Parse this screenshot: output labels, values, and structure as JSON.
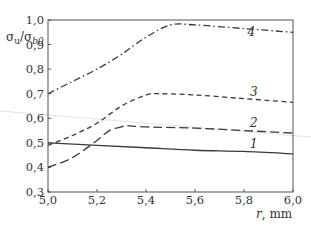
{
  "chart_data": {
    "type": "line",
    "title": "",
    "xlabel": "r, mm",
    "xlabel_var": "r",
    "xlabel_unit": "mm",
    "ylabel": "σu/σb0",
    "ylabel_parts": {
      "sigma1": "σ",
      "sub1": "u",
      "slash": "/",
      "sigma2": "σ",
      "sub2": "b0"
    },
    "xlim": [
      5.0,
      6.0
    ],
    "ylim": [
      0.3,
      1.0
    ],
    "grid": false,
    "legend": "inline curve numbers",
    "x_ticks": [
      "5,0",
      "5,2",
      "5,4",
      "5,6",
      "5,8",
      "6,0"
    ],
    "y_ticks": [
      "0,3",
      "0,4",
      "0,5",
      "0,6",
      "0,7",
      "0,8",
      "0,9",
      "1,0"
    ],
    "series": [
      {
        "name": "1",
        "style": "solid",
        "x": [
          5.0,
          5.2,
          5.4,
          5.6,
          5.8,
          6.0
        ],
        "values": [
          0.5,
          0.49,
          0.48,
          0.47,
          0.465,
          0.455
        ]
      },
      {
        "name": "2",
        "style": "long-dash",
        "x": [
          5.0,
          5.1,
          5.2,
          5.25,
          5.3,
          5.32,
          5.4,
          5.6,
          5.8,
          6.0
        ],
        "values": [
          0.4,
          0.44,
          0.51,
          0.55,
          0.565,
          0.57,
          0.565,
          0.56,
          0.55,
          0.54
        ]
      },
      {
        "name": "3",
        "style": "short-dash",
        "x": [
          5.0,
          5.1,
          5.2,
          5.3,
          5.4,
          5.45,
          5.6,
          5.8,
          6.0
        ],
        "values": [
          0.49,
          0.53,
          0.58,
          0.65,
          0.695,
          0.7,
          0.695,
          0.68,
          0.665
        ]
      },
      {
        "name": "4",
        "style": "dash-dot",
        "x": [
          5.0,
          5.1,
          5.2,
          5.3,
          5.4,
          5.5,
          5.6,
          5.8,
          6.0
        ],
        "values": [
          0.7,
          0.75,
          0.8,
          0.86,
          0.93,
          0.98,
          0.98,
          0.965,
          0.95
        ]
      }
    ],
    "curve_labels": [
      {
        "text": "1",
        "x": 5.84,
        "y": 0.48
      },
      {
        "text": "2",
        "x": 5.84,
        "y": 0.565
      },
      {
        "text": "3",
        "x": 5.84,
        "y": 0.69
      },
      {
        "text": "4",
        "x": 5.83,
        "y": 0.935
      }
    ]
  },
  "colors": {
    "line": "#3a3a3a",
    "axis": "#555555",
    "text": "#333333",
    "artifact": "#d8d8d8"
  }
}
